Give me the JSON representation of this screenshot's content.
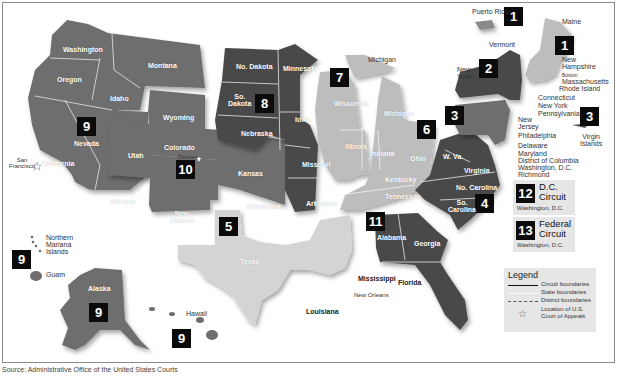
{
  "circuits": [
    {
      "number": "1",
      "states": [
        "Maine",
        "New Hampshire",
        "Massachusetts",
        "Rhode Island",
        "Puerto Rico"
      ],
      "court_location": "Boston"
    },
    {
      "number": "2",
      "states": [
        "New York",
        "Vermont",
        "Connecticut"
      ],
      "court_location": "New York"
    },
    {
      "number": "3",
      "states": [
        "Pennsylvania",
        "New Jersey",
        "Delaware",
        "Virgin Islands"
      ],
      "court_location": "Philadelphia"
    },
    {
      "number": "4",
      "states": [
        "Maryland",
        "W. Va.",
        "Virginia",
        "No. Carolina",
        "So. Carolina"
      ],
      "court_location": "Richmond"
    },
    {
      "number": "5",
      "states": [
        "Texas",
        "Louisiana",
        "Mississippi"
      ],
      "court_location": "New Orleans"
    },
    {
      "number": "6",
      "states": [
        "Michigan",
        "Ohio",
        "Kentucky",
        "Tennessee"
      ],
      "court_location": "Cincinnati"
    },
    {
      "number": "7",
      "states": [
        "Wisconsin",
        "Illinois",
        "Indiana"
      ],
      "court_location": "Chicago"
    },
    {
      "number": "8",
      "states": [
        "No. Dakota",
        "So. Dakota",
        "Nebraska",
        "Minnesota",
        "Iowa",
        "Missouri",
        "Arkansas"
      ],
      "court_location": "St. Louis"
    },
    {
      "number": "9",
      "states": [
        "Washington",
        "Oregon",
        "California",
        "Nevada",
        "Idaho",
        "Montana",
        "Arizona",
        "Alaska",
        "Hawaii",
        "Guam",
        "Northern Mariana Islands"
      ],
      "court_location": "San Francisco"
    },
    {
      "number": "10",
      "states": [
        "Wyoming",
        "Utah",
        "Colorado",
        "Kansas",
        "New Mexico",
        "Oklahoma"
      ],
      "court_location": "Denver"
    },
    {
      "number": "11",
      "states": [
        "Alabama",
        "Georgia",
        "Florida"
      ],
      "court_location": "Atlanta"
    }
  ],
  "labels": {
    "puerto_rico": "Puerto Rico",
    "maine": "Maine",
    "vermont": "Vermont",
    "new_hampshire": "New\nHampshire",
    "boston": "Boston",
    "massachusetts": "Massachusetts",
    "rhode_island": "Rhode Island",
    "new_york_top": "New\nYork",
    "connecticut": "Connecticut",
    "new_york": "New York",
    "pennsylvania": "Pennsylvania",
    "new_jersey": "New\nJersey",
    "philadelphia": "Philadelphia",
    "delaware": "Delaware",
    "maryland": "Maryland",
    "district_of_columbia": "District of Columbia",
    "washington_dc": "Washington, D.C.",
    "richmond": "Richmond",
    "virgin_islands": "Virgin\nIslands",
    "michigan_up": "Michigan",
    "washington": "Washington",
    "oregon": "Oregon",
    "idaho": "Idaho",
    "montana": "Montana",
    "nevada": "Nevada",
    "california": "California",
    "san_francisco": "San\nFrancisco",
    "arizona": "Arizona",
    "wyoming": "Wyoming",
    "utah": "Utah",
    "colorado": "Colorado",
    "denver": "Denver",
    "new_mexico": "New\nMexico",
    "kansas": "Kansas",
    "oklahoma": "Oklahoma",
    "no_dakota": "No. Dakota",
    "so_dakota": "So.\nDakota",
    "nebraska": "Nebraska",
    "minnesota": "Minnesota",
    "iowa": "Iowa",
    "missouri": "Missouri",
    "st_louis": "St. Louis",
    "arkansas": "Arkansas",
    "wisconsin": "Wisconsin",
    "chicago": "Chicago",
    "illinois": "Illinois",
    "indiana": "Indiana",
    "michigan": "Michigan",
    "ohio": "Ohio",
    "kentucky": "Kentucky",
    "tennessee": "Tennessee",
    "w_va": "W. Va.",
    "virginia": "Virginia",
    "no_carolina": "No. Carolina",
    "so_carolina": "So.\nCarolina",
    "texas": "Texas",
    "louisiana": "Louisiana",
    "mississippi": "Mississippi",
    "new_orleans": "New Orleans",
    "alabama": "Alabama",
    "georgia": "Georgia",
    "atlanta": "Atlanta",
    "florida": "Florida",
    "northern_mariana": "Northern\nMariana\nIslands",
    "guam": "Guam",
    "alaska": "Alaska",
    "hawaii": "Hawaii"
  },
  "special_circuits": [
    {
      "number": "12",
      "name": "D.C.\nCircuit",
      "location": "Washington, D.C."
    },
    {
      "number": "13",
      "name": "Federal\nCircuit",
      "location": "Washington, D.C."
    }
  ],
  "legend": {
    "title": "Legend",
    "items": [
      {
        "style": "solid",
        "label": "Circuit boundaries"
      },
      {
        "style": "white",
        "label": "State boundaries"
      },
      {
        "style": "dashed",
        "label": "District boundaries"
      },
      {
        "style": "star",
        "label": "Location of U.S.\nCourt of Appeals"
      }
    ]
  },
  "source": "Source: Administrative Office of the United States Courts",
  "colors": {
    "dark": "#4a4a4a",
    "medium": "#6e6e6e",
    "light": "#bdbdbd",
    "lighter": "#d4d4d4",
    "panel": "#e6e6e6"
  }
}
